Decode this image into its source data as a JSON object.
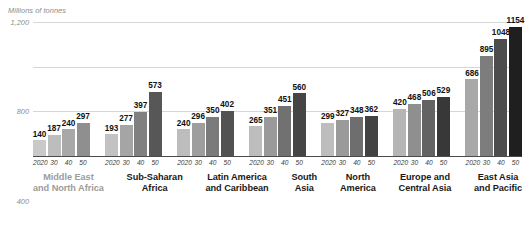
{
  "chart_data": {
    "type": "bar",
    "title": "",
    "subtitle": "",
    "ylabel": "Millions of tonnes",
    "xlabel": "",
    "ylim": [
      0,
      1200
    ],
    "yticks": [
      0,
      400,
      800,
      1200
    ],
    "ytick_labels": [
      "0",
      "400",
      "800",
      "1,200"
    ],
    "grid": true,
    "legend_position": "none",
    "x": [
      "2020",
      "30",
      "40",
      "50"
    ],
    "categories": [
      "Middle East and North Africa",
      "Sub-Saharan Africa",
      "Latin America and Caribbean",
      "South Asia",
      "North America",
      "Europe and Central Asia",
      "East Asia and Pacific"
    ],
    "series": [
      {
        "name": "2020",
        "values": [
          140,
          193,
          240,
          265,
          299,
          420,
          686
        ]
      },
      {
        "name": "30",
        "values": [
          187,
          277,
          296,
          351,
          327,
          468,
          895
        ]
      },
      {
        "name": "40",
        "values": [
          240,
          397,
          350,
          451,
          348,
          506,
          1048
        ]
      },
      {
        "name": "50",
        "values": [
          297,
          573,
          402,
          560,
          362,
          529,
          1154
        ]
      }
    ],
    "bar_colors": [
      "#bdbdbd",
      "#9a9a9a",
      "#6e6e6e",
      "#3c3c3c"
    ],
    "groups": [
      {
        "caption_lines": [
          "Middle East",
          "and North Africa"
        ],
        "muted": true,
        "bars": [
          {
            "year": "2020",
            "value": 140,
            "label": "140",
            "color": "#c9c9c9"
          },
          {
            "year": "30",
            "value": 187,
            "label": "187",
            "color": "#bdbdbd"
          },
          {
            "year": "40",
            "value": 240,
            "label": "240",
            "color": "#a8a8a8"
          },
          {
            "year": "50",
            "value": 297,
            "label": "297",
            "color": "#8f8f8f"
          }
        ]
      },
      {
        "caption_lines": [
          "Sub-Saharan",
          "Africa"
        ],
        "muted": false,
        "bars": [
          {
            "year": "2020",
            "value": 193,
            "label": "193",
            "color": "#c2c2c2"
          },
          {
            "year": "30",
            "value": 277,
            "label": "277",
            "color": "#a5a5a5"
          },
          {
            "year": "40",
            "value": 397,
            "label": "397",
            "color": "#808080"
          },
          {
            "year": "50",
            "value": 573,
            "label": "573",
            "color": "#575757"
          }
        ]
      },
      {
        "caption_lines": [
          "Latin America",
          "and Caribbean"
        ],
        "muted": false,
        "bars": [
          {
            "year": "2020",
            "value": 240,
            "label": "240",
            "color": "#bdbdbd"
          },
          {
            "year": "30",
            "value": 296,
            "label": "296",
            "color": "#9e9e9e"
          },
          {
            "year": "40",
            "value": 350,
            "label": "350",
            "color": "#7b7b7b"
          },
          {
            "year": "50",
            "value": 402,
            "label": "402",
            "color": "#525252"
          }
        ]
      },
      {
        "caption_lines": [
          "South",
          "Asia"
        ],
        "muted": false,
        "bars": [
          {
            "year": "2020",
            "value": 265,
            "label": "265",
            "color": "#bdbdbd"
          },
          {
            "year": "30",
            "value": 351,
            "label": "351",
            "color": "#9a9a9a"
          },
          {
            "year": "40",
            "value": 451,
            "label": "451",
            "color": "#717171"
          },
          {
            "year": "50",
            "value": 560,
            "label": "560",
            "color": "#454545"
          }
        ]
      },
      {
        "caption_lines": [
          "North",
          "America"
        ],
        "muted": false,
        "bars": [
          {
            "year": "2020",
            "value": 299,
            "label": "299",
            "color": "#bdbdbd"
          },
          {
            "year": "30",
            "value": 327,
            "label": "327",
            "color": "#9a9a9a"
          },
          {
            "year": "40",
            "value": 348,
            "label": "348",
            "color": "#6e6e6e"
          },
          {
            "year": "50",
            "value": 362,
            "label": "362",
            "color": "#424242"
          }
        ]
      },
      {
        "caption_lines": [
          "Europe and",
          "Central Asia"
        ],
        "muted": false,
        "bars": [
          {
            "year": "2020",
            "value": 420,
            "label": "420",
            "color": "#b5b5b5"
          },
          {
            "year": "30",
            "value": 468,
            "label": "468",
            "color": "#8f8f8f"
          },
          {
            "year": "40",
            "value": 506,
            "label": "506",
            "color": "#636363"
          },
          {
            "year": "50",
            "value": 529,
            "label": "529",
            "color": "#383838"
          }
        ]
      },
      {
        "caption_lines": [
          "East Asia",
          "and Pacific"
        ],
        "muted": false,
        "bars": [
          {
            "year": "2020",
            "value": 686,
            "label": "686",
            "color": "#a8a8a8"
          },
          {
            "year": "30",
            "value": 895,
            "label": "895",
            "color": "#7d7d7d"
          },
          {
            "year": "40",
            "value": 1048,
            "label": "1048",
            "color": "#4d4d4d"
          },
          {
            "year": "50",
            "value": 1154,
            "label": "1154",
            "color": "#1f1f1f"
          }
        ]
      }
    ]
  }
}
